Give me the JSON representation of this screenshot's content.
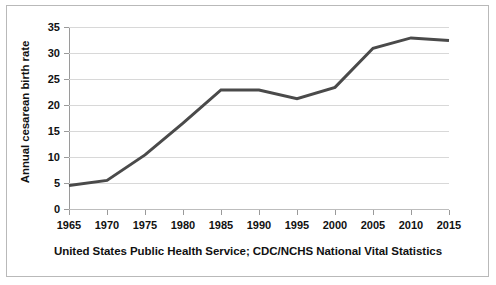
{
  "chart_data": {
    "type": "line",
    "title": "",
    "xlabel": "",
    "ylabel": "Annual cesarean birth rate",
    "caption": "United States Public Health Service; CDC/NCHS National Vital Statistics",
    "x": [
      1965,
      1970,
      1975,
      1980,
      1985,
      1990,
      1995,
      2000,
      2005,
      2010,
      2015
    ],
    "values": [
      4.5,
      5.5,
      10.4,
      16.5,
      22.9,
      22.9,
      21.2,
      23.4,
      30.9,
      32.9,
      32.4
    ],
    "xticklabels": [
      "1965",
      "1970",
      "1975",
      "1980",
      "1985",
      "1990",
      "1995",
      "2000",
      "2005",
      "2010",
      "2015"
    ],
    "yticklabels": [
      "0",
      "5",
      "10",
      "15",
      "20",
      "25",
      "30",
      "35"
    ],
    "yticks": [
      0,
      5,
      10,
      15,
      20,
      25,
      30,
      35
    ],
    "xlim": [
      1965,
      2015
    ],
    "ylim": [
      0,
      35
    ],
    "grid": "horizontal",
    "legend": "none",
    "series_color": "#4a4a4a",
    "grid_color": "#d8d8d8",
    "axis_color": "#9a9a9a",
    "text_color": "#111111",
    "frame_color": "#b9b9b9",
    "background": "#ffffff"
  }
}
